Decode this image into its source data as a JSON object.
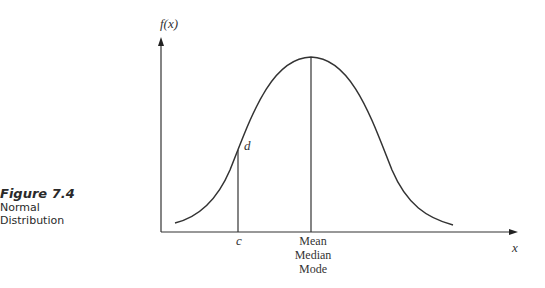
{
  "caption": {
    "figure_label": "Figure 7.4",
    "line1": "Normal",
    "line2": "Distribution"
  },
  "diagram": {
    "y_axis_label": "f(x)",
    "x_axis_label": "x",
    "point_label_d": "d",
    "point_label_c": "c",
    "center_labels": [
      "Mean",
      "Median",
      "Mode"
    ],
    "line_color": "#333333"
  }
}
